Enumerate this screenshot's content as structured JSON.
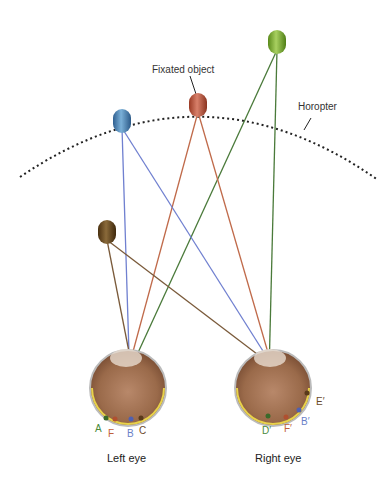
{
  "title_labels": {
    "fixated_object": "Fixated object",
    "horopter": "Horopter",
    "left_eye": "Left eye",
    "right_eye": "Right eye"
  },
  "left_eye_points": [
    {
      "label": "A",
      "color": "#4a8a3a"
    },
    {
      "label": "F",
      "color": "#c0603a"
    },
    {
      "label": "B",
      "color": "#6a7fc8"
    },
    {
      "label": "C",
      "color": "#6b4a2a"
    }
  ],
  "right_eye_points": [
    {
      "label": "D′",
      "color": "#4a8a3a"
    },
    {
      "label": "F′",
      "color": "#c0603a"
    },
    {
      "label": "B′",
      "color": "#6a7fc8"
    },
    {
      "label": "E′",
      "color": "#6b4a2a"
    }
  ],
  "objects": [
    {
      "name": "fixated-object",
      "color": "#c0503a"
    },
    {
      "name": "blue-object",
      "color": "#4a82b8"
    },
    {
      "name": "green-object",
      "color": "#7ab030"
    },
    {
      "name": "brown-object",
      "color": "#6b4a1a"
    }
  ],
  "line_colors": {
    "green": "#4a7a3a",
    "red": "#c06a4a",
    "blue": "#7080d0",
    "brown": "#7a5a3a"
  }
}
